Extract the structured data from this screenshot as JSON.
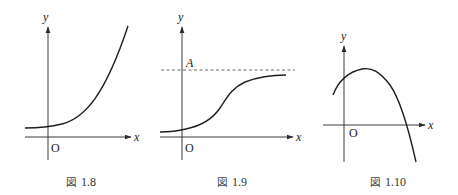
{
  "figures": [
    {
      "id": "1.8",
      "caption_prefix": "図",
      "caption_number": "1.8",
      "x_axis_label": "x",
      "y_axis_label": "y",
      "origin_label": "O",
      "curve_description": "exponential growth curve, positive y-intercept, increasing steeply to the right"
    },
    {
      "id": "1.9",
      "caption_prefix": "図",
      "caption_number": "1.9",
      "x_axis_label": "x",
      "y_axis_label": "y",
      "origin_label": "O",
      "asymptote_label": "A",
      "curve_description": "logistic (S-shaped) curve approaching horizontal asymptote y = A (dashed)"
    },
    {
      "id": "1.10",
      "caption_prefix": "図",
      "caption_number": "1.10",
      "x_axis_label": "x",
      "y_axis_label": "y",
      "origin_label": "O",
      "curve_description": "downward-opening curve with maximum at small positive x, crossing the x-axis on the right"
    }
  ],
  "colors": {
    "background": "#ffffff",
    "line": "#1e1e1e",
    "axis": "#3a3a3a",
    "dashed": "#555555",
    "text": "#222222"
  }
}
